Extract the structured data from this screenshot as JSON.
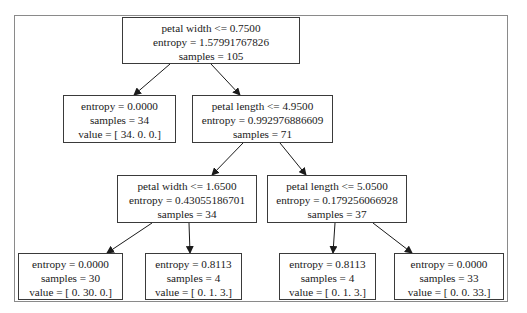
{
  "diagram": {
    "type": "decision-tree",
    "nodes": {
      "root": {
        "line1": "petal width <= 0.7500",
        "line2": "entropy = 1.57991767826",
        "line3": "samples = 105"
      },
      "n1_left": {
        "line1": "entropy = 0.0000",
        "line2": "samples = 34",
        "line3": "value = [ 34.   0.   0.]"
      },
      "n1_right": {
        "line1": "petal length <= 4.9500",
        "line2": "entropy = 0.992976886609",
        "line3": "samples = 71"
      },
      "n2_left": {
        "line1": "petal width <= 1.6500",
        "line2": "entropy = 0.43055186701",
        "line3": "samples = 34"
      },
      "n2_right": {
        "line1": "petal length <= 5.0500",
        "line2": "entropy = 0.179256066928",
        "line3": "samples = 37"
      },
      "leaf1": {
        "line1": "entropy = 0.0000",
        "line2": "samples = 30",
        "line3": "value = [  0.  30.   0.]"
      },
      "leaf2": {
        "line1": "entropy = 0.8113",
        "line2": "samples = 4",
        "line3": "value = [ 0.  1.  3.]"
      },
      "leaf3": {
        "line1": "entropy = 0.8113",
        "line2": "samples = 4",
        "line3": "value = [ 0.  1.  3.]"
      },
      "leaf4": {
        "line1": "entropy = 0.0000",
        "line2": "samples = 33",
        "line3": "value = [  0.   0.  33.]"
      }
    },
    "edges": [
      [
        "root",
        "n1_left"
      ],
      [
        "root",
        "n1_right"
      ],
      [
        "n1_right",
        "n2_left"
      ],
      [
        "n1_right",
        "n2_right"
      ],
      [
        "n2_left",
        "leaf1"
      ],
      [
        "n2_left",
        "leaf2"
      ],
      [
        "n2_right",
        "leaf3"
      ],
      [
        "n2_right",
        "leaf4"
      ]
    ],
    "colors": {
      "border": "#3a3a3a",
      "frame": "#8a8a8a",
      "edge": "#1a1a1a"
    }
  }
}
